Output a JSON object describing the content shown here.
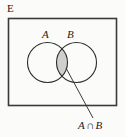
{
  "figure": {
    "type": "venn-diagram",
    "universe_label": "E",
    "set_a_label": "A",
    "set_b_label": "B",
    "callout_label": {
      "left_operand": "A",
      "operator": "∩",
      "right_operand": "B",
      "full_text": "A ∩ B"
    },
    "colors": {
      "background": "#fbfbfa",
      "stroke": "#2b2b2b",
      "rectangle_stroke": "#3a3a3a",
      "shade_fill": "#cfcfcf",
      "text": "#1b1b1b",
      "leader_line": "#3a3a3a"
    },
    "geometry": {
      "rectangle": {
        "x": 8,
        "y": 18,
        "width": 109,
        "height": 88
      },
      "circle_a": {
        "cx": 47.5,
        "cy": 62.5,
        "r": 20
      },
      "circle_b": {
        "cx": 76.5,
        "cy": 62.5,
        "r": 20
      },
      "leader_line": {
        "x1": 66,
        "y1": 68,
        "x2": 93,
        "y2": 118
      }
    }
  }
}
